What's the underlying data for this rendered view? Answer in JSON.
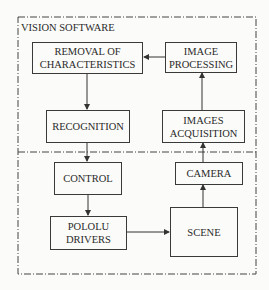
{
  "diagram": {
    "title": "VISION SOFTWARE",
    "boxes": {
      "removal": "REMOVAL OF CHARACTERISTICS",
      "removal_l1": "REMOVAL OF",
      "removal_l2": "CHARACTERISTICS",
      "processing_l1": "IMAGE",
      "processing_l2": "PROCESSING",
      "recognition": "RECOGNITION",
      "acquisition_l1": "IMAGES",
      "acquisition_l2": "ACQUISITION",
      "control": "CONTROL",
      "camera": "CAMERA",
      "pololu_l1": "POLOLU",
      "pololu_l2": "DRIVERS",
      "scene": "SCENE"
    },
    "edges": [
      {
        "from": "IMAGE PROCESSING",
        "to": "REMOVAL OF CHARACTERISTICS"
      },
      {
        "from": "REMOVAL OF CHARACTERISTICS",
        "to": "RECOGNITION"
      },
      {
        "from": "RECOGNITION",
        "to": "CONTROL"
      },
      {
        "from": "CONTROL",
        "to": "POLOLU DRIVERS"
      },
      {
        "from": "POLOLU DRIVERS",
        "to": "SCENE"
      },
      {
        "from": "SCENE",
        "to": "CAMERA"
      },
      {
        "from": "CAMERA",
        "to": "IMAGES ACQUISITION"
      },
      {
        "from": "IMAGES ACQUISITION",
        "to": "IMAGE PROCESSING"
      }
    ]
  }
}
